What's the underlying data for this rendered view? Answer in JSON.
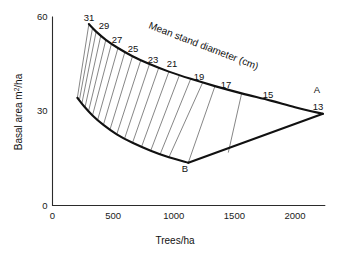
{
  "chart_data": {
    "type": "line",
    "title": "",
    "annotation": "Mean stand diameter (cm)",
    "xlabel": "Trees/ha",
    "ylabel": "Basal area m2/ha",
    "ylabel_parts": {
      "pre": "Basal area m",
      "sup": "2",
      "post": "/ha"
    },
    "xlim": [
      0,
      2250
    ],
    "ylim": [
      0,
      60
    ],
    "xticks": [
      0,
      500,
      1000,
      1500,
      2000
    ],
    "xtick_labels": [
      "0",
      "500",
      "1000",
      "1500",
      "2000"
    ],
    "yticks": [
      0,
      30,
      60
    ],
    "ytick_labels": [
      "0",
      "30",
      "60"
    ],
    "grid": false,
    "legend": "none",
    "diameter_labels": [
      "31",
      "29",
      "27",
      "25",
      "23",
      "21",
      "19",
      "17",
      "15",
      "13"
    ],
    "endpoint_labels": [
      "A",
      "B"
    ],
    "series": [
      {
        "name": "Curve A (upper limit)",
        "points": [
          [
            300,
            57.6
          ],
          [
            360,
            55.2
          ],
          [
            440,
            52.6
          ],
          [
            540,
            50.0
          ],
          [
            660,
            47.4
          ],
          [
            800,
            44.9
          ],
          [
            960,
            42.5
          ],
          [
            1140,
            40.2
          ],
          [
            1340,
            37.9
          ],
          [
            1560,
            35.6
          ],
          [
            1800,
            33.3
          ],
          [
            2000,
            31.2
          ],
          [
            2230,
            29.1
          ]
        ]
      },
      {
        "name": "Curve B (lower limit)",
        "points": [
          [
            205,
            34.2
          ],
          [
            260,
            31.5
          ],
          [
            330,
            28.6
          ],
          [
            420,
            25.6
          ],
          [
            530,
            22.6
          ],
          [
            660,
            19.9
          ],
          [
            810,
            17.4
          ],
          [
            960,
            15.3
          ],
          [
            1120,
            13.6
          ]
        ]
      },
      {
        "name": "Lower boundary B to A",
        "points": [
          [
            1120,
            13.6
          ],
          [
            2230,
            29.1
          ]
        ]
      }
    ],
    "diameter_fan": [
      {
        "label": "31",
        "top": [
          300,
          57.6
        ],
        "bottom": [
          205,
          34.2
        ]
      },
      {
        "label": "",
        "top": [
          330,
          56.3
        ],
        "bottom": [
          222,
          33.5
        ]
      },
      {
        "label": "29",
        "top": [
          360,
          55.2
        ],
        "bottom": [
          243,
          32.5
        ]
      },
      {
        "label": "",
        "top": [
          398,
          53.9
        ],
        "bottom": [
          268,
          31.2
        ]
      },
      {
        "label": "27",
        "top": [
          440,
          52.6
        ],
        "bottom": [
          297,
          29.9
        ]
      },
      {
        "label": "",
        "top": [
          486,
          51.3
        ],
        "bottom": [
          330,
          28.6
        ]
      },
      {
        "label": "25",
        "top": [
          540,
          50.0
        ],
        "bottom": [
          372,
          27.1
        ]
      },
      {
        "label": "",
        "top": [
          596,
          48.6
        ],
        "bottom": [
          420,
          25.6
        ]
      },
      {
        "label": "23",
        "top": [
          660,
          47.4
        ],
        "bottom": [
          474,
          24.1
        ]
      },
      {
        "label": "",
        "top": [
          728,
          46.1
        ],
        "bottom": [
          530,
          22.6
        ]
      },
      {
        "label": "21",
        "top": [
          800,
          44.9
        ],
        "bottom": [
          594,
          21.2
        ]
      },
      {
        "label": "",
        "top": [
          876,
          43.7
        ],
        "bottom": [
          660,
          19.9
        ]
      },
      {
        "label": "19",
        "top": [
          960,
          42.5
        ],
        "bottom": [
          734,
          18.6
        ]
      },
      {
        "label": "",
        "top": [
          1046,
          41.3
        ],
        "bottom": [
          810,
          17.4
        ]
      },
      {
        "label": "17",
        "top": [
          1140,
          40.2
        ],
        "bottom": [
          888,
          16.3
        ]
      },
      {
        "label": "",
        "top": [
          1238,
          39.0
        ],
        "bottom": [
          960,
          15.3
        ]
      },
      {
        "label": "15",
        "top": [
          1340,
          37.9
        ],
        "bottom": [
          1120,
          13.6
        ]
      },
      {
        "label": "",
        "top": [
          1560,
          35.6
        ],
        "bottom": [
          1450,
          16.8
        ]
      },
      {
        "label": "13",
        "top": [
          2230,
          29.1
        ],
        "bottom": [
          2230,
          29.1
        ]
      }
    ],
    "label_positions": [
      {
        "text": "31",
        "x": 89,
        "y": 21
      },
      {
        "text": "29",
        "x": 104,
        "y": 29
      },
      {
        "text": "27",
        "x": 117,
        "y": 43
      },
      {
        "text": "25",
        "x": 133,
        "y": 52
      },
      {
        "text": "23",
        "x": 153,
        "y": 63
      },
      {
        "text": "21",
        "x": 172,
        "y": 67
      },
      {
        "text": "19",
        "x": 199,
        "y": 80
      },
      {
        "text": "17",
        "x": 226,
        "y": 88
      },
      {
        "text": "15",
        "x": 268,
        "y": 98
      },
      {
        "text": "13",
        "x": 318,
        "y": 110
      }
    ],
    "endpoint_positions": [
      {
        "text": "A",
        "x": 317,
        "y": 93
      },
      {
        "text": "B",
        "x": 185,
        "y": 172
      }
    ]
  }
}
